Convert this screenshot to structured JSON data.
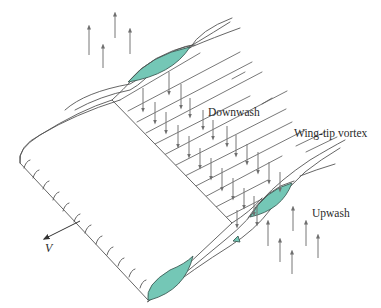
{
  "diagram": {
    "labels": {
      "downwash": "Downwash",
      "vortex": "Wing-tip vortex",
      "upwash": "Upwash",
      "velocity": "V"
    },
    "colors": {
      "airfoil_fill": "#74c7b6",
      "line": "#555555",
      "arrow": "#6f6f6f",
      "background": "#ffffff"
    },
    "arrow_groups": {
      "upwash_left": {
        "direction": "up",
        "count": 4
      },
      "downwash": {
        "direction": "down",
        "count": 24
      },
      "upwash_right": {
        "direction": "up",
        "count": 7
      }
    }
  }
}
